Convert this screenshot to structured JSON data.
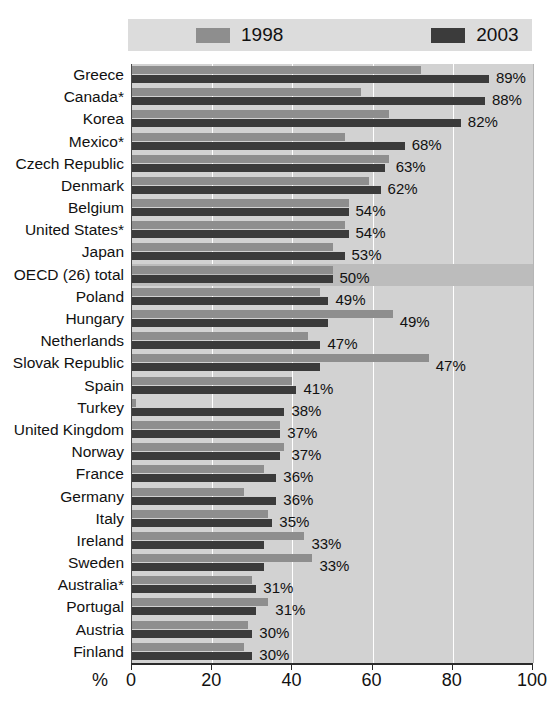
{
  "legend": {
    "items": [
      {
        "label": "1998",
        "color": "#8e8e8e"
      },
      {
        "label": "2003",
        "color": "#3b3b3b"
      }
    ]
  },
  "axis": {
    "unit_label": "%",
    "ticks": [
      "0",
      "20",
      "40",
      "60",
      "80",
      "100"
    ]
  },
  "caption": "",
  "chart_data": {
    "type": "bar",
    "title": "",
    "subtitle": "",
    "xlabel": "%",
    "ylabel": "",
    "xlim": [
      0,
      100
    ],
    "grid": true,
    "orientation": "horizontal",
    "legend_position": "top",
    "legend": [
      "1998",
      "2003"
    ],
    "categories": [
      "Greece",
      "Canada*",
      "Korea",
      "Mexico*",
      "Czech Republic",
      "Denmark",
      "Belgium",
      "United States*",
      "Japan",
      "OECD (26) total",
      "Poland",
      "Hungary",
      "Netherlands",
      "Slovak Republic",
      "Spain",
      "Turkey",
      "United Kingdom",
      "Norway",
      "France",
      "Germany",
      "Italy",
      "Ireland",
      "Sweden",
      "Australia*",
      "Portugal",
      "Austria",
      "Finland"
    ],
    "series": [
      {
        "name": "1998",
        "values": [
          72,
          57,
          64,
          53,
          64,
          59,
          54,
          53,
          50,
          50,
          47,
          65,
          44,
          74,
          40,
          1,
          37,
          38,
          33,
          28,
          34,
          43,
          45,
          30,
          34,
          29,
          28
        ]
      },
      {
        "name": "2003",
        "values": [
          89,
          88,
          82,
          68,
          63,
          62,
          54,
          54,
          53,
          50,
          49,
          49,
          47,
          47,
          41,
          38,
          37,
          37,
          36,
          36,
          35,
          33,
          33,
          31,
          31,
          30,
          30
        ]
      }
    ],
    "data_labels": [
      "89%",
      "88%",
      "82%",
      "68%",
      "63%",
      "62%",
      "54%",
      "54%",
      "53%",
      "50%",
      "49%",
      "49%",
      "47%",
      "47%",
      "41%",
      "38%",
      "37%",
      "37%",
      "36%",
      "36%",
      "35%",
      "33%",
      "33%",
      "31%",
      "31%",
      "30%",
      "30%"
    ],
    "highlight_category": "OECD (26) total"
  }
}
